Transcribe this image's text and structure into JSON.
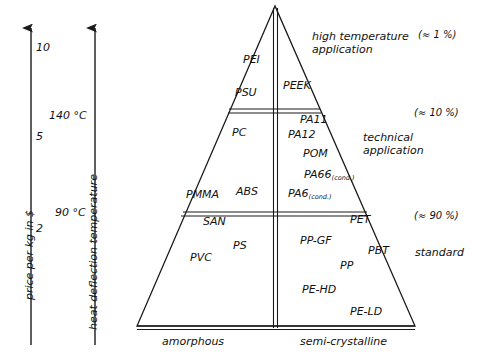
{
  "diagram": {
    "line_color": "#1a1a1a",
    "text_color": "#111111",
    "background": "#ffffff"
  },
  "axes": {
    "price": {
      "title": "price per kg in $",
      "ticks": [
        {
          "label": "10",
          "x": 36,
          "y": 42
        },
        {
          "label": "5",
          "x": 36,
          "y": 131
        },
        {
          "label": "2",
          "x": 36,
          "y": 223
        }
      ]
    },
    "temperature": {
      "title": "heat deflection temperature",
      "ticks": [
        {
          "label": "140 °C",
          "x": 50,
          "y": 110
        },
        {
          "label": "90 °C",
          "x": 55,
          "y": 207
        }
      ]
    }
  },
  "tiers": [
    {
      "name": "high-temperature",
      "annotation": "high temperature\napplication",
      "annotation_line1": "high temperature",
      "annotation_line2": "application",
      "percent": "(≈ 1 %)",
      "amorphous": [
        "PEI",
        "PSU"
      ],
      "semicrystalline": [
        "PEEK"
      ]
    },
    {
      "name": "technical",
      "annotation_line1": "technical",
      "annotation_line2": "application",
      "percent": "(≈ 10 %)",
      "amorphous": [
        "PC",
        "PMMA",
        "ABS"
      ],
      "semicrystalline": [
        "PA11",
        "PA12",
        "POM",
        "PA66",
        "PA6"
      ]
    },
    {
      "name": "standard",
      "annotation_line1": "standard",
      "annotation_line2": "",
      "percent": "(≈ 90 %)",
      "amorphous": [
        "SAN",
        "PS",
        "PVC"
      ],
      "semicrystalline": [
        "PET",
        "PP-GF",
        "PBT",
        "PP",
        "PE-HD",
        "PE-LD"
      ]
    }
  ],
  "base_categories": {
    "left": "amorphous",
    "right": "semi-crystalline"
  },
  "polymers": [
    {
      "key": "pei",
      "label": "PEI",
      "x": 243,
      "y": 62,
      "tier": "high-temperature",
      "side": "amorphous"
    },
    {
      "key": "psu",
      "label": "PSU",
      "x": 235,
      "y": 95,
      "tier": "high-temperature",
      "side": "amorphous"
    },
    {
      "key": "peek",
      "label": "PEEK",
      "x": 283,
      "y": 88,
      "tier": "high-temperature",
      "side": "semi-crystalline"
    },
    {
      "key": "pc",
      "label": "PC",
      "x": 232,
      "y": 135,
      "tier": "technical",
      "side": "amorphous"
    },
    {
      "key": "pmma",
      "label": "PMMA",
      "x": 186,
      "y": 197,
      "tier": "technical",
      "side": "amorphous"
    },
    {
      "key": "abs",
      "label": "ABS",
      "x": 236,
      "y": 194,
      "tier": "technical",
      "side": "amorphous"
    },
    {
      "key": "pa11",
      "label": "PA11",
      "x": 300,
      "y": 122,
      "tier": "technical",
      "side": "semi-crystalline"
    },
    {
      "key": "pa12",
      "label": "PA12",
      "x": 288,
      "y": 137,
      "tier": "technical",
      "side": "semi-crystalline"
    },
    {
      "key": "pom",
      "label": "POM",
      "x": 303,
      "y": 156,
      "tier": "technical",
      "side": "semi-crystalline"
    },
    {
      "key": "pa66",
      "label": "PA66",
      "x": 304,
      "y": 177,
      "tier": "technical",
      "side": "semi-crystalline",
      "sub": "(cond.)"
    },
    {
      "key": "pa6",
      "label": "PA6",
      "x": 288,
      "y": 196,
      "tier": "technical",
      "side": "semi-crystalline",
      "sub": "(cond.)"
    },
    {
      "key": "san",
      "label": "SAN",
      "x": 203,
      "y": 224,
      "tier": "standard",
      "side": "amorphous"
    },
    {
      "key": "ps",
      "label": "PS",
      "x": 233,
      "y": 248,
      "tier": "standard",
      "side": "amorphous"
    },
    {
      "key": "pvc",
      "label": "PVC",
      "x": 190,
      "y": 260,
      "tier": "standard",
      "side": "amorphous"
    },
    {
      "key": "pet",
      "label": "PET",
      "x": 350,
      "y": 222,
      "tier": "standard",
      "side": "semi-crystalline"
    },
    {
      "key": "ppgf",
      "label": "PP-GF",
      "x": 300,
      "y": 243,
      "tier": "standard",
      "side": "semi-crystalline"
    },
    {
      "key": "pbt",
      "label": "PBT",
      "x": 368,
      "y": 253,
      "tier": "standard",
      "side": "semi-crystalline"
    },
    {
      "key": "pp",
      "label": "PP",
      "x": 340,
      "y": 268,
      "tier": "standard",
      "side": "semi-crystalline"
    },
    {
      "key": "pehd",
      "label": "PE-HD",
      "x": 302,
      "y": 292,
      "tier": "standard",
      "side": "semi-crystalline"
    },
    {
      "key": "peld",
      "label": "PE-LD",
      "x": 350,
      "y": 314,
      "tier": "standard",
      "side": "semi-crystalline"
    }
  ],
  "annotations": [
    {
      "key": "high-temp-l1",
      "text": "high temperature",
      "x": 312,
      "y": 38
    },
    {
      "key": "high-temp-l2",
      "text": "application",
      "x": 312,
      "y": 51
    },
    {
      "key": "technical-l1",
      "text": "technical",
      "x": 363,
      "y": 139
    },
    {
      "key": "technical-l2",
      "text": "application",
      "x": 363,
      "y": 152
    },
    {
      "key": "standard-l1",
      "text": "standard",
      "x": 415,
      "y": 254
    }
  ],
  "percents": [
    {
      "key": "pct-high",
      "text": "(≈ 1 %)",
      "x": 418,
      "y": 35
    },
    {
      "key": "pct-technical",
      "text": "(≈ 10 %)",
      "x": 414,
      "y": 113
    },
    {
      "key": "pct-standard",
      "text": "(≈ 90 %)",
      "x": 414,
      "y": 216
    }
  ]
}
